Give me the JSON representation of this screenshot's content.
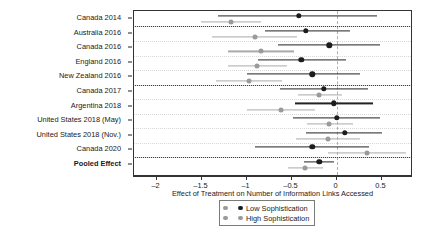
{
  "chart_data": {
    "type": "scatter",
    "title": "",
    "xlabel": "Effect of Treatment on Number of Information Links Accessed",
    "ylabel": "",
    "xlim": [
      -2.25,
      0.85
    ],
    "xticks": [
      -2,
      -1.5,
      -1,
      -0.5,
      0,
      0.5
    ],
    "xticklabels": [
      "–2",
      "–1.5",
      "–1",
      "–0.5",
      "0",
      "0.5"
    ],
    "grid": "horizontal-dotted",
    "reference_line": 0,
    "legend_position": "bottom-center",
    "legend": [
      {
        "name": "Low Sophistication",
        "color": "#1c1c1c"
      },
      {
        "name": "High Sophistication",
        "color": "#9a9a9a"
      }
    ],
    "categories": [
      "Canada 2014",
      "Australia 2016",
      "Canada 2016",
      "England 2016",
      "New Zealand 2016",
      "Canada 2017",
      "Argentina 2018",
      "United States 2018 (May)",
      "United States 2018 (Nov.)",
      "Canada 2020",
      "Pooled Effect"
    ],
    "series": [
      {
        "name": "Low Sophistication",
        "color": "#1c1c1c",
        "values": [
          -0.42,
          -0.34,
          -0.08,
          -0.39,
          -0.27,
          -0.14,
          -0.03,
          0.0,
          0.09,
          -0.27,
          -0.19
        ],
        "ci_low": [
          -1.32,
          -0.79,
          -0.65,
          -0.87,
          -1.0,
          -0.63,
          -0.46,
          -0.48,
          -0.34,
          -0.91,
          -0.36
        ],
        "ci_high": [
          0.45,
          0.15,
          0.48,
          0.11,
          0.26,
          0.35,
          0.41,
          0.48,
          0.51,
          0.36,
          -0.03
        ]
      },
      {
        "name": "High Sophistication",
        "color": "#9a9a9a",
        "values": [
          -1.17,
          -0.91,
          -0.84,
          -0.88,
          -0.97,
          -0.19,
          -0.62,
          -0.08,
          -0.1,
          0.34,
          -0.35
        ],
        "ci_low": [
          -1.51,
          -1.38,
          -1.21,
          -1.21,
          -1.34,
          -0.43,
          -1.0,
          -0.33,
          -0.45,
          -0.09,
          -0.54
        ],
        "ci_high": [
          -0.84,
          -0.44,
          -0.47,
          -0.55,
          -0.6,
          0.06,
          -0.24,
          0.18,
          0.26,
          0.77,
          -0.15
        ]
      }
    ],
    "group_separators_after": [
      "Canada 2014",
      "New Zealand 2016",
      "Canada 2020"
    ],
    "bold_categories": [
      "Pooled Effect"
    ]
  }
}
